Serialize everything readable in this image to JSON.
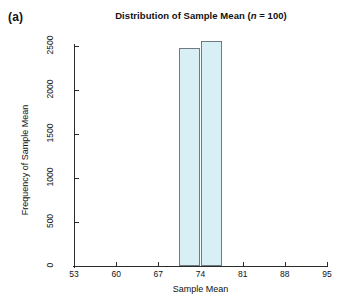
{
  "panel": {
    "label": "(a)"
  },
  "chart_data": {
    "type": "bar",
    "title": "Distribution of Sample Mean (n = 100)",
    "title_main": "Distribution of Sample Mean (",
    "title_italic": "n",
    "title_tail": " = 100)",
    "xlabel": "Sample Mean",
    "ylabel": "Frequency of Sample Mean",
    "xlim": [
      53,
      95
    ],
    "ylim": [
      0,
      2500
    ],
    "grid": false,
    "legend": null,
    "xticks": [
      "53",
      "60",
      "67",
      "74",
      "81",
      "88",
      "95"
    ],
    "xtick_values": [
      53,
      60,
      67,
      74,
      81,
      88,
      95
    ],
    "yticks": [
      "0",
      "500",
      "1000",
      "1500",
      "2000",
      "2500"
    ],
    "ytick_values": [
      0,
      500,
      1000,
      1500,
      2000,
      2500
    ],
    "bin_edges": [
      70.5,
      74.0,
      77.5
    ],
    "categories": [
      "70.5-74.0",
      "74.0-77.5"
    ],
    "values": [
      2480,
      2560
    ],
    "bar_color": "#d8eff6",
    "bar_edge_color": "#6f7b80",
    "bars": [
      {
        "x0": 70.5,
        "x1": 74.0,
        "value": 2480
      },
      {
        "x0": 74.0,
        "x1": 77.5,
        "value": 2560
      }
    ]
  }
}
